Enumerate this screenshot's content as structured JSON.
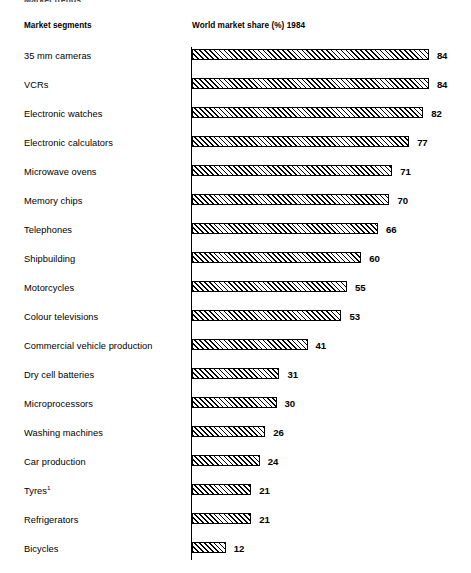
{
  "figure": {
    "title_clipped": "Market trends",
    "headers": {
      "segments": "Market segments",
      "share": "World market share (%) 1984"
    },
    "footnote_marker": "1"
  },
  "chart_data": {
    "type": "bar",
    "orientation": "horizontal",
    "title": "Market trends",
    "xlabel": "World market share (%) 1984",
    "ylabel": "Market segments",
    "xlim": [
      0,
      84
    ],
    "grid": false,
    "legend": "none",
    "value_suffix": "",
    "categories": [
      "35 mm cameras",
      "VCRs",
      "Electronic watches",
      "Electronic calculators",
      "Microwave ovens",
      "Memory chips",
      "Telephones",
      "Shipbuilding",
      "Motorcycles",
      "Colour televisions",
      "Commercial vehicle production",
      "Dry cell batteries",
      "Microprocessors",
      "Washing machines",
      "Car production",
      "Tyres",
      "Refrigerators",
      "Bicycles"
    ],
    "values": [
      84,
      84,
      82,
      77,
      71,
      70,
      66,
      60,
      55,
      53,
      41,
      31,
      30,
      26,
      24,
      21,
      21,
      12
    ],
    "bars": [
      {
        "label": "35 mm cameras",
        "value": 84,
        "value_text": "84",
        "footnote": ""
      },
      {
        "label": "VCRs",
        "value": 84,
        "value_text": "84",
        "footnote": ""
      },
      {
        "label": "Electronic watches",
        "value": 82,
        "value_text": "82",
        "footnote": ""
      },
      {
        "label": "Electronic calculators",
        "value": 77,
        "value_text": "77",
        "footnote": ""
      },
      {
        "label": "Microwave ovens",
        "value": 71,
        "value_text": "71",
        "footnote": ""
      },
      {
        "label": "Memory chips",
        "value": 70,
        "value_text": "70",
        "footnote": ""
      },
      {
        "label": "Telephones",
        "value": 66,
        "value_text": "66",
        "footnote": ""
      },
      {
        "label": "Shipbuilding",
        "value": 60,
        "value_text": "60",
        "footnote": ""
      },
      {
        "label": "Motorcycles",
        "value": 55,
        "value_text": "55",
        "footnote": ""
      },
      {
        "label": "Colour televisions",
        "value": 53,
        "value_text": "53",
        "footnote": ""
      },
      {
        "label": "Commercial vehicle production",
        "value": 41,
        "value_text": "41",
        "footnote": ""
      },
      {
        "label": "Dry cell batteries",
        "value": 31,
        "value_text": "31",
        "footnote": ""
      },
      {
        "label": "Microprocessors",
        "value": 30,
        "value_text": "30",
        "footnote": ""
      },
      {
        "label": "Washing machines",
        "value": 26,
        "value_text": "26",
        "footnote": ""
      },
      {
        "label": "Car production",
        "value": 24,
        "value_text": "24",
        "footnote": ""
      },
      {
        "label": "Tyres",
        "value": 21,
        "value_text": "21",
        "footnote": "1"
      },
      {
        "label": "Refrigerators",
        "value": 21,
        "value_text": "21",
        "footnote": ""
      },
      {
        "label": "Bicycles",
        "value": 12,
        "value_text": "12",
        "footnote": ""
      }
    ],
    "colors": {
      "bar_outline": "#000000",
      "bar_fill": "#ffffff",
      "hatch": "#000000",
      "text": "#000000",
      "axis": "#000000"
    }
  },
  "layout": {
    "bar_origin_x": 192,
    "first_bar_y": 47,
    "row_pitch": 29,
    "px_per_unit": 2.82,
    "bar_height": 11,
    "value_gap": 8
  }
}
